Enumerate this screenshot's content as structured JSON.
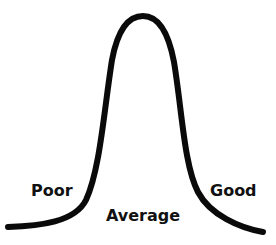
{
  "diagram": {
    "type": "bell-curve",
    "curve_color": "#0a0a0a",
    "labels": {
      "poor": "Poor",
      "average": "Average",
      "good": "Good"
    }
  }
}
